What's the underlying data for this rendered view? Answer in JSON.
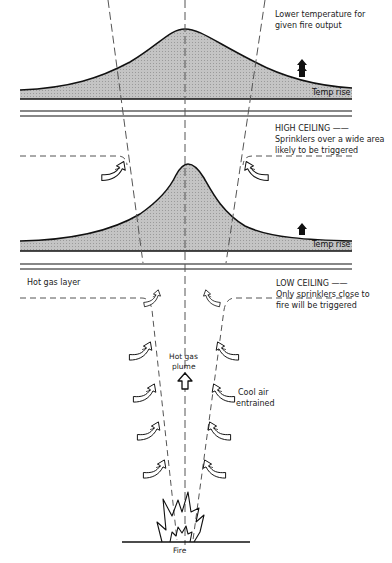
{
  "diagram": {
    "type": "fire-plume-ceiling-jet",
    "colors": {
      "line": "#111111",
      "shade": "#bdbdbd",
      "dash": "#555555",
      "background": "#ffffff"
    },
    "high_ceiling": {
      "note": "Lower temperature for\ngiven fire output",
      "note_line1": "Lower temperature for",
      "note_line2": "given fire output",
      "temp_label": "Temp rise",
      "title": "HIGH CEILING",
      "desc_line1": "Sprinklers over a wide area",
      "desc_line2": "likely to be triggered"
    },
    "low_ceiling": {
      "temp_label": "Temp rise",
      "title": "LOW CEILING",
      "desc_line1": "Only sprinklers close to",
      "desc_line2": "fire will be triggered",
      "hot_gas_layer": "Hot gas layer"
    },
    "plume": {
      "label_line1": "Hot gas",
      "label_line2": "plume",
      "entrained_line1": "Cool air",
      "entrained_line2": "entrained"
    },
    "source": {
      "label": "Fire"
    }
  }
}
